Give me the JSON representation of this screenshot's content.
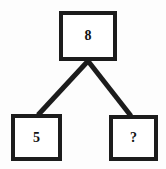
{
  "diagram": {
    "type": "binary-tree",
    "background_color": "#fdfdfd",
    "stroke_color": "#1c1c1c",
    "fill_color": "#ffffff",
    "nodes": [
      {
        "id": "root",
        "label": "8",
        "role": "parent",
        "x": 59,
        "y": 11,
        "width": 58,
        "height": 50
      },
      {
        "id": "left",
        "label": "5",
        "role": "child",
        "x": 11,
        "y": 114,
        "width": 51,
        "height": 47
      },
      {
        "id": "right",
        "label": "?",
        "role": "child-unknown",
        "x": 109,
        "y": 115,
        "width": 49,
        "height": 46
      }
    ],
    "edges": [
      {
        "id": "edge-root-left",
        "from": "root",
        "to": "left",
        "x1": 88,
        "y1": 61,
        "x2": 38,
        "y2": 115
      },
      {
        "id": "edge-root-right",
        "from": "root",
        "to": "right",
        "x1": 88,
        "y1": 61,
        "x2": 131,
        "y2": 116
      }
    ]
  }
}
